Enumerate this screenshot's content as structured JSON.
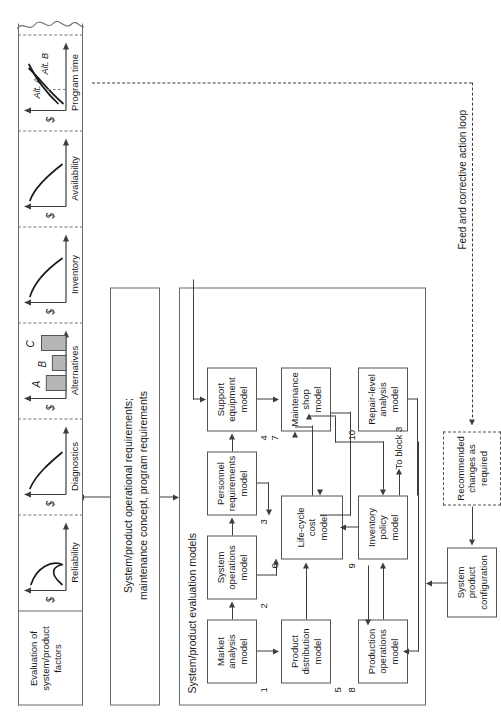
{
  "figure": {
    "orientation": "rotated-90-ccw"
  },
  "inputs": {
    "requirements_box": "System/product operational requirements;\nmaintenance concept, program requirements",
    "requirements_line1": "System/product operational requirements;",
    "requirements_line2": "maintenance concept, program requirements"
  },
  "models_panel": {
    "title": "System/product evaluation models",
    "blocks": [
      {
        "num": "1",
        "label": "Market\nanalysis\nmodel",
        "lines": [
          "Market",
          "analysis",
          "model"
        ]
      },
      {
        "num": "2",
        "label": "System\noperations\nmodel",
        "lines": [
          "System",
          "operations",
          "model"
        ]
      },
      {
        "num": "3",
        "label": "Personnel\nrequirements\nmodel",
        "lines": [
          "Personnel",
          "requirements",
          "model"
        ]
      },
      {
        "num": "4",
        "label": "Support\nequipment\nmodel",
        "lines": [
          "Support",
          "equipment",
          "model"
        ]
      },
      {
        "num": "5",
        "label": "Product\ndistribution\nmodel",
        "lines": [
          "Product",
          "distribution",
          "model"
        ]
      },
      {
        "num": "6",
        "label": "Life-cycle\ncost\nmodel",
        "lines": [
          "Life-cycle",
          "cost",
          "model"
        ]
      },
      {
        "num": "7",
        "label": "Maintenance\nshop\nmodel",
        "lines": [
          "Maintenance",
          "shop",
          "model"
        ]
      },
      {
        "num": "8",
        "label": "Production\noperations\nmodel",
        "lines": [
          "Production",
          "operations",
          "model"
        ]
      },
      {
        "num": "9",
        "label": "Inventory\npolicy\nmodel",
        "lines": [
          "Inventory",
          "policy",
          "model"
        ]
      },
      {
        "num": "10",
        "label": "Repair-level\nanalysis\nmodel",
        "lines": [
          "Repair-level",
          "analysis",
          "model"
        ]
      }
    ],
    "to_block_3": "To block 3"
  },
  "evaluation_panel": {
    "title": "Evaluation of\nsystem/product\nfactors",
    "title_lines": [
      "Evaluation of",
      "system/product",
      "factors"
    ],
    "y_axis_label": "$",
    "charts": [
      {
        "name": "reliability",
        "xlabel": "Reliability",
        "ylabel": "$",
        "type": "curve-u",
        "note": "U-shaped cost vs reliability curve"
      },
      {
        "name": "diagnostics",
        "xlabel": "Diagnostics",
        "ylabel": "$",
        "type": "curve-decay",
        "note": "decreasing cost vs diagnostics curve"
      },
      {
        "name": "alternatives",
        "xlabel": "Alternatives",
        "ylabel": "$",
        "type": "bar",
        "categories": [
          "A",
          "B",
          "C"
        ],
        "values": [
          58,
          40,
          72
        ]
      },
      {
        "name": "inventory",
        "xlabel": "Inventory",
        "ylabel": "$",
        "type": "curve-decay",
        "note": "decreasing cost vs inventory curve"
      },
      {
        "name": "availability",
        "xlabel": "Availability",
        "ylabel": "$",
        "type": "curve-decay",
        "note": "decreasing cost vs availability curve"
      },
      {
        "name": "program-time",
        "xlabel": "Program time",
        "ylabel": "$",
        "type": "crossing-lines",
        "series": [
          {
            "name": "Alt. A"
          },
          {
            "name": "Alt. B"
          }
        ],
        "note": "two cost curves crossing at a break-even point marked with a dashed tick"
      }
    ]
  },
  "chart_data": {
    "type": "bar",
    "title": "Alternatives",
    "categories": [
      "A",
      "B",
      "C"
    ],
    "values": [
      58,
      40,
      72
    ],
    "xlabel": "Alternatives",
    "ylabel": "$",
    "ylim": [
      0,
      100
    ],
    "grid": false,
    "legend": "none"
  },
  "feedback": {
    "config_box": "System\nproduct\nconfiguration",
    "config_lines": [
      "System",
      "product",
      "configuration"
    ],
    "changes_box": "Recommended\nchanges as\nrequired",
    "changes_lines": [
      "Recommended",
      "changes as",
      "required"
    ],
    "loop_label": "Feed and corrective action loop"
  },
  "colors": {
    "line": "#3d3d3d",
    "panel_border": "#6a6a6a",
    "box_border": "#555555",
    "bar_fill": "#b6b6b6",
    "background": "#ffffff"
  }
}
